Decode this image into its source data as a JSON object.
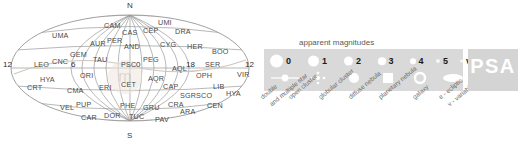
{
  "chart_data": {
    "type": "scatter",
    "projection": "aitoff",
    "xlabel": "Right Ascension (hours)",
    "ylabel": "Declination",
    "grid": true,
    "legend_position": "right",
    "xlim": [
      24,
      0
    ],
    "ylim": [
      -90,
      90
    ],
    "ra_tick_labels": [
      "12",
      "6",
      "0",
      "18",
      "12"
    ],
    "pole_labels": {
      "north": "N",
      "south": "S"
    },
    "constellations": [
      {
        "abbr": "UMA",
        "x": 52,
        "y": 31
      },
      {
        "abbr": "CAM",
        "x": 104,
        "y": 21
      },
      {
        "abbr": "CAS",
        "x": 122,
        "y": 28
      },
      {
        "abbr": "CEP",
        "x": 143,
        "y": 26
      },
      {
        "abbr": "UMI",
        "x": 158,
        "y": 18
      },
      {
        "abbr": "DRA",
        "x": 175,
        "y": 27
      },
      {
        "abbr": "AUR",
        "x": 90,
        "y": 39
      },
      {
        "abbr": "PER",
        "x": 107,
        "y": 36
      },
      {
        "abbr": "AND",
        "x": 124,
        "y": 42
      },
      {
        "abbr": "CYG",
        "x": 160,
        "y": 40
      },
      {
        "abbr": "HER",
        "x": 187,
        "y": 42
      },
      {
        "abbr": "GEM",
        "x": 70,
        "y": 50
      },
      {
        "abbr": "TAU",
        "x": 93,
        "y": 55
      },
      {
        "abbr": "PSC",
        "x": 121,
        "y": 60
      },
      {
        "abbr": "PEG",
        "x": 143,
        "y": 55
      },
      {
        "abbr": "BOO",
        "x": 212,
        "y": 47
      },
      {
        "abbr": "SER",
        "x": 205,
        "y": 60
      },
      {
        "abbr": "LEO",
        "x": 34,
        "y": 60
      },
      {
        "abbr": "CNC",
        "x": 52,
        "y": 57
      },
      {
        "abbr": "AQL",
        "x": 172,
        "y": 64
      },
      {
        "abbr": "HYA",
        "x": 40,
        "y": 75
      },
      {
        "abbr": "ORI",
        "x": 80,
        "y": 71
      },
      {
        "abbr": "AQR",
        "x": 148,
        "y": 74
      },
      {
        "abbr": "OPH",
        "x": 196,
        "y": 71
      },
      {
        "abbr": "VIR",
        "x": 237,
        "y": 70
      },
      {
        "abbr": "CRT",
        "x": 27,
        "y": 83
      },
      {
        "abbr": "CMA",
        "x": 67,
        "y": 86
      },
      {
        "abbr": "ERI",
        "x": 99,
        "y": 83
      },
      {
        "abbr": "CET",
        "x": 121,
        "y": 80
      },
      {
        "abbr": "CAP",
        "x": 163,
        "y": 82
      },
      {
        "abbr": "LIB",
        "x": 213,
        "y": 82
      },
      {
        "abbr": "HYA",
        "x": 226,
        "y": 89
      },
      {
        "abbr": "SGR",
        "x": 180,
        "y": 91
      },
      {
        "abbr": "SCO",
        "x": 196,
        "y": 91
      },
      {
        "abbr": "VEL",
        "x": 60,
        "y": 103
      },
      {
        "abbr": "PUP",
        "x": 76,
        "y": 100
      },
      {
        "abbr": "PHE",
        "x": 120,
        "y": 101
      },
      {
        "abbr": "GRU",
        "x": 143,
        "y": 103
      },
      {
        "abbr": "CRA",
        "x": 168,
        "y": 100
      },
      {
        "abbr": "CEN",
        "x": 207,
        "y": 101
      },
      {
        "abbr": "ARA",
        "x": 180,
        "y": 107
      },
      {
        "abbr": "CAR",
        "x": 81,
        "y": 113
      },
      {
        "abbr": "DOR",
        "x": 104,
        "y": 111
      },
      {
        "abbr": "TUC",
        "x": 129,
        "y": 112
      },
      {
        "abbr": "PAV",
        "x": 155,
        "y": 115
      }
    ]
  },
  "sky_chart": {
    "name": "all-sky-map",
    "north_label": "N",
    "south_label": "S",
    "ra_labels": [
      {
        "text": "12",
        "x": 3,
        "y": 64
      },
      {
        "text": "6",
        "x": 71,
        "y": 64
      },
      {
        "text": "0",
        "x": 136,
        "y": 64
      },
      {
        "text": "18",
        "x": 186,
        "y": 64
      },
      {
        "text": "12",
        "x": 245,
        "y": 64
      }
    ]
  },
  "legend": {
    "title": "apparent magnitudes",
    "magnitudes": [
      {
        "label": "0",
        "size": 13
      },
      {
        "label": "1",
        "size": 11
      },
      {
        "label": "2",
        "size": 9
      },
      {
        "label": "3",
        "size": 7.5
      },
      {
        "label": "4",
        "size": 5.5
      },
      {
        "label": "5",
        "size": 4
      },
      {
        "label": "v.",
        "size": 3
      }
    ],
    "symbols": [
      {
        "name": "double-star-symbol",
        "caption_line1": "double",
        "caption_line2": "and multiple star"
      },
      {
        "name": "open-cluster-symbol",
        "caption_line1": "open cluster",
        "caption_line2": ""
      },
      {
        "name": "globular-cluster-symbol",
        "caption_line1": "globular cluster",
        "caption_line2": ""
      },
      {
        "name": "diffuse-nebula-symbol",
        "caption_line1": "diffuse nebula",
        "caption_line2": ""
      },
      {
        "name": "planetary-nebula-symbol",
        "caption_line1": "planetary nebula",
        "caption_line2": ""
      },
      {
        "name": "galaxy-symbol",
        "caption_line1": "galaxy",
        "caption_line2": ""
      },
      {
        "name": "ecliptic-symbol",
        "caption_line1": "e - ecliptic",
        "caption_line2": "v - variable star"
      }
    ],
    "ecliptic_marker_label": "e",
    "brand": "PSA",
    "colors": {
      "legend_background": "#d9d9d9",
      "brand_background": "#d4d4d4",
      "brand_text": "#ffffff",
      "symbol_fill": "#ffffff",
      "caption_text": "#6d6d6d",
      "chart_line": "#8a8a8a"
    }
  }
}
